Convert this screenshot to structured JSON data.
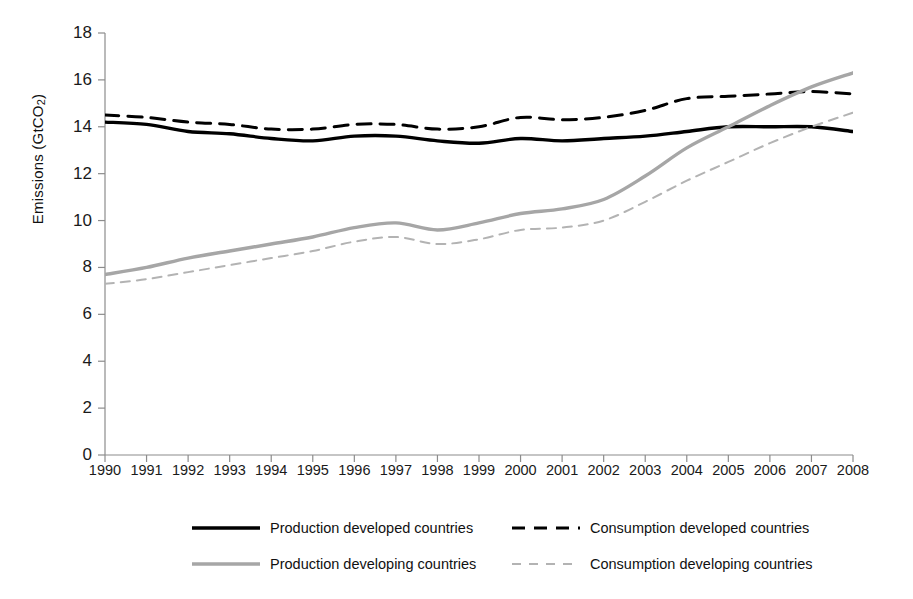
{
  "chart_data": {
    "type": "line",
    "title": "",
    "xlabel": "",
    "ylabel": "Emissions (GtCO2)",
    "ylabel_rich": {
      "prefix": "Emissions  (GtCO",
      "sub": "2",
      "suffix": ")"
    },
    "xlim": [
      1990,
      2008
    ],
    "ylim": [
      0,
      18
    ],
    "ytick_step": 2,
    "grid": false,
    "legend_position": "bottom",
    "categories": [
      1990,
      1991,
      1992,
      1993,
      1994,
      1995,
      1996,
      1997,
      1998,
      1999,
      2000,
      2001,
      2002,
      2003,
      2004,
      2005,
      2006,
      2007,
      2008
    ],
    "xticklabels": [
      "1990",
      "1991",
      "1992",
      "1993",
      "1994",
      "1995",
      "1996",
      "1997",
      "1998",
      "1999",
      "2000",
      "2001",
      "2002",
      "2003",
      "2004",
      "2005",
      "2006",
      "2007",
      "2008"
    ],
    "yticklabels": [
      "0",
      "2",
      "4",
      "6",
      "8",
      "10",
      "12",
      "14",
      "16",
      "18"
    ],
    "yticks": [
      0,
      2,
      4,
      6,
      8,
      10,
      12,
      14,
      16,
      18
    ],
    "series": [
      {
        "name": "Production developed countries",
        "key": "production-developed",
        "color": "#000000",
        "style": "solid",
        "width": 3.4,
        "values": [
          14.2,
          14.1,
          13.8,
          13.7,
          13.5,
          13.4,
          13.6,
          13.6,
          13.4,
          13.3,
          13.5,
          13.4,
          13.5,
          13.6,
          13.8,
          14.0,
          14.0,
          14.0,
          13.8
        ]
      },
      {
        "name": "Consumption developed countries",
        "key": "consumption-developed",
        "color": "#000000",
        "style": "dashed",
        "width": 3.0,
        "values": [
          14.5,
          14.4,
          14.2,
          14.1,
          13.9,
          13.9,
          14.1,
          14.1,
          13.9,
          14.0,
          14.4,
          14.3,
          14.4,
          14.7,
          15.2,
          15.3,
          15.4,
          15.5,
          15.4
        ]
      },
      {
        "name": "Production developing countries",
        "key": "production-developing",
        "color": "#a6a6a6",
        "style": "solid",
        "width": 3.4,
        "values": [
          7.7,
          8.0,
          8.4,
          8.7,
          9.0,
          9.3,
          9.7,
          9.9,
          9.6,
          9.9,
          10.3,
          10.5,
          10.9,
          11.9,
          13.1,
          14.0,
          14.9,
          15.7,
          16.3
        ]
      },
      {
        "name": "Consumption developing countries",
        "key": "consumption-developing",
        "color": "#b3b3b3",
        "style": "dashed",
        "width": 2.0,
        "values": [
          7.3,
          7.5,
          7.8,
          8.1,
          8.4,
          8.7,
          9.1,
          9.3,
          9.0,
          9.2,
          9.6,
          9.7,
          10.0,
          10.8,
          11.7,
          12.5,
          13.3,
          14.0,
          14.6
        ]
      }
    ]
  },
  "legend": {
    "items": [
      {
        "label": "Production developed countries",
        "key": "production-developed"
      },
      {
        "label": "Consumption developed countries",
        "key": "consumption-developed"
      },
      {
        "label": "Production developing countries",
        "key": "production-developing"
      },
      {
        "label": "Consumption developing countries",
        "key": "consumption-developing"
      }
    ]
  }
}
